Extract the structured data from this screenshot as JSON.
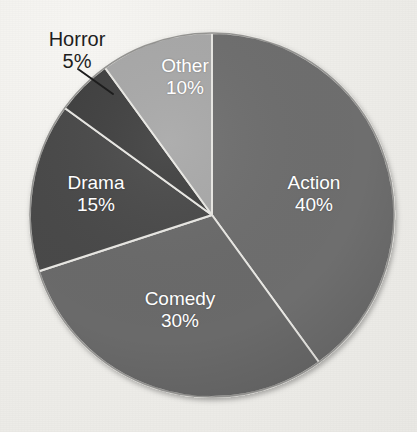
{
  "background": {
    "paper_color": "#efeeea",
    "cropped_title_fragment": " "
  },
  "chart_data": {
    "type": "pie",
    "title": "",
    "xlabel": "",
    "ylabel": "",
    "legend_position": "none",
    "labels_inside_slices": true,
    "units": "percent",
    "categories": [
      "Action",
      "Comedy",
      "Drama",
      "Horror",
      "Other"
    ],
    "values": [
      40,
      30,
      15,
      5,
      10
    ],
    "value_labels": [
      "40%",
      "30%",
      "15%",
      "5%",
      "10%"
    ],
    "colors": [
      "#6e6e6e",
      "#6a6a6a",
      "#4a4a4a",
      "#3f3f3f",
      "#a8a8a8"
    ],
    "start_angle_deg": 0,
    "direction": "clockwise",
    "slices": [
      {
        "name": "Action",
        "value": 40,
        "value_label": "40%",
        "color": "#6e6e6e",
        "label_placement": "inside",
        "label_color": "#ffffff"
      },
      {
        "name": "Comedy",
        "value": 30,
        "value_label": "30%",
        "color": "#6a6a6a",
        "label_placement": "inside",
        "label_color": "#ffffff"
      },
      {
        "name": "Drama",
        "value": 15,
        "value_label": "15%",
        "color": "#4a4a4a",
        "label_placement": "inside",
        "label_color": "#ffffff"
      },
      {
        "name": "Horror",
        "value": 5,
        "value_label": "5%",
        "color": "#3f3f3f",
        "label_placement": "outside-callout",
        "label_color": "#1d1d1d"
      },
      {
        "name": "Other",
        "value": 10,
        "value_label": "10%",
        "color": "#a8a8a8",
        "label_placement": "inside",
        "label_color": "#ffffff"
      }
    ],
    "total": 100
  }
}
